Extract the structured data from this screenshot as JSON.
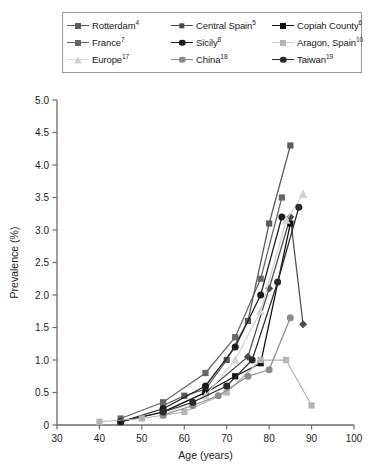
{
  "chart_data": {
    "type": "line",
    "title": "",
    "xlabel": "Age (years)",
    "ylabel": "Prevalence (%)",
    "xlim": [
      30,
      100
    ],
    "ylim": [
      0,
      5.0
    ],
    "xticks": [
      "30",
      "40",
      "50",
      "60",
      "70",
      "80",
      "90",
      "100"
    ],
    "yticks": [
      "0",
      "0.5",
      "1.0",
      "1.5",
      "2.0",
      "2.5",
      "3.0",
      "3.5",
      "4.0",
      "4.5",
      "5.0"
    ],
    "grid": false,
    "legend_position": "top",
    "series": [
      {
        "name": "Rotterdam",
        "label": "Rotterdam",
        "superscript": "4",
        "marker": "square",
        "color": "#5a5a5a",
        "x": [
          55,
          60,
          65,
          70,
          75,
          80,
          85
        ],
        "y": [
          0.3,
          0.45,
          0.55,
          1.0,
          1.6,
          3.1,
          4.3
        ]
      },
      {
        "name": "Central Spain",
        "label": "Central Spain",
        "superscript": "5",
        "marker": "diamond",
        "color": "#4a4a4a",
        "x": [
          45,
          55,
          65,
          75,
          80,
          85,
          88
        ],
        "y": [
          0.05,
          0.2,
          0.5,
          1.05,
          2.1,
          3.2,
          1.55
        ]
      },
      {
        "name": "Copiah County",
        "label": "Copiah County",
        "superscript": "6",
        "marker": "square",
        "color": "#111111",
        "x": [
          45,
          55,
          65,
          72,
          78,
          85
        ],
        "y": [
          0.05,
          0.2,
          0.5,
          0.75,
          0.95,
          3.1
        ]
      },
      {
        "name": "France",
        "label": "France",
        "superscript": "7",
        "marker": "square",
        "color": "#666666",
        "x": [
          45,
          55,
          65,
          72,
          78,
          83
        ],
        "y": [
          0.1,
          0.35,
          0.8,
          1.35,
          2.25,
          3.5
        ]
      },
      {
        "name": "Sicily",
        "label": "Sicily",
        "superscript": "8",
        "marker": "circle",
        "color": "#1c1c1c",
        "x": [
          45,
          55,
          65,
          72,
          78,
          83
        ],
        "y": [
          0.05,
          0.25,
          0.6,
          1.2,
          2.0,
          3.2
        ]
      },
      {
        "name": "Aragon, Spain",
        "label": "Aragon, Spain",
        "superscript": "10",
        "marker": "square",
        "color": "#b4b4b4",
        "x": [
          40,
          50,
          60,
          70,
          78,
          84,
          90
        ],
        "y": [
          0.05,
          0.1,
          0.2,
          0.5,
          1.0,
          1.0,
          0.3
        ]
      },
      {
        "name": "Europe",
        "label": "Europe",
        "superscript": "17",
        "marker": "triangle",
        "color": "#d2d2d2",
        "x": [
          55,
          65,
          72,
          78,
          84,
          88
        ],
        "y": [
          0.15,
          0.45,
          1.0,
          1.75,
          3.15,
          3.55
        ]
      },
      {
        "name": "China",
        "label": "China",
        "superscript": "18",
        "marker": "circle",
        "color": "#8c8c8c",
        "x": [
          55,
          62,
          68,
          75,
          80,
          85
        ],
        "y": [
          0.15,
          0.3,
          0.45,
          0.75,
          0.85,
          1.65
        ]
      },
      {
        "name": "Taiwan",
        "label": "Taiwan",
        "superscript": "19",
        "marker": "circle",
        "color": "#2a2a2a",
        "x": [
          55,
          62,
          70,
          76,
          82,
          87
        ],
        "y": [
          0.2,
          0.35,
          0.6,
          1.0,
          2.2,
          3.35
        ]
      }
    ]
  },
  "legend": {
    "rows": [
      [
        "Rotterdam",
        "Central Spain",
        "Copiah County"
      ],
      [
        "France",
        "Sicily",
        "Aragon, Spain"
      ],
      [
        "Europe",
        "China",
        "Taiwan"
      ]
    ]
  }
}
